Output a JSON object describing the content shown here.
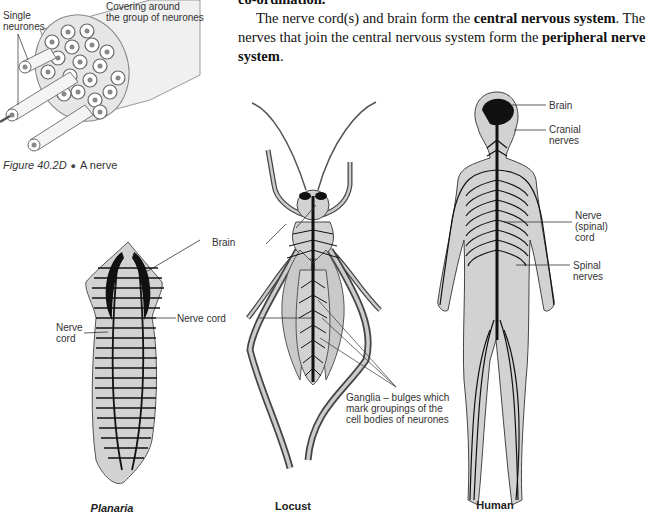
{
  "text": {
    "line_top": "co-ordination.",
    "para_line1_pre": "The nerve cord(s) and brain form the ",
    "para_line1_bold": "central nervous system",
    "para_line1_post": ". The",
    "para_line2_pre": "nerves that join the central nervous system form the ",
    "para_line2_bold": "peripheral nerve",
    "para_line3_bold": "system",
    "para_line3_post": "."
  },
  "nerve_figure": {
    "label_single": "Single",
    "label_neurones": "neurones",
    "label_covering1": "Covering around",
    "label_covering2": "the group of neurones",
    "caption_fig": "Figure 40.2D",
    "caption_bullet": "●",
    "caption_text": "A nerve"
  },
  "planaria": {
    "label_nerve": "Nerve",
    "label_cord": "cord",
    "name": "Planaria"
  },
  "locust": {
    "label_brain": "Brain",
    "label_nerve_cord": "Nerve cord",
    "label_ganglia1": "Ganglia – bulges which",
    "label_ganglia2": "mark groupings of the",
    "label_ganglia3": "cell bodies of neurones",
    "name": "Locust"
  },
  "human": {
    "label_brain": "Brain",
    "label_cranial1": "Cranial",
    "label_cranial2": "nerves",
    "label_nerve1": "Nerve",
    "label_nerve2": "(spinal)",
    "label_nerve3": "cord",
    "label_spinal1": "Spinal",
    "label_spinal2": "nerves",
    "name": "Human"
  },
  "colors": {
    "body_fill": "#d2d2d2",
    "nerve": "#111111",
    "outline": "#555555"
  }
}
